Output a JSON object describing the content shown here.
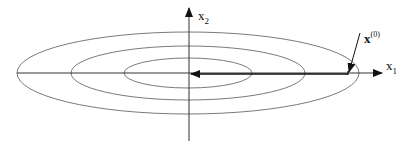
{
  "diagram": {
    "type": "contour-plot-gradient-descent",
    "axes": {
      "x": {
        "label_main": "x",
        "label_sub": "1"
      },
      "y": {
        "label_main": "x",
        "label_sub": "2"
      }
    },
    "start_point": {
      "label_main": "x",
      "label_sup": "(0)"
    },
    "contours": [
      {
        "name": "outer",
        "cx": 188,
        "cy": 73,
        "rx": 171,
        "ry": 41
      },
      {
        "name": "middle",
        "cx": 188,
        "cy": 73,
        "rx": 117,
        "ry": 27
      },
      {
        "name": "inner",
        "cx": 188,
        "cy": 73,
        "rx": 64,
        "ry": 15
      }
    ],
    "colors": {
      "contour": "#7a7a7a",
      "axis": "#222222",
      "path": "#111111"
    }
  }
}
